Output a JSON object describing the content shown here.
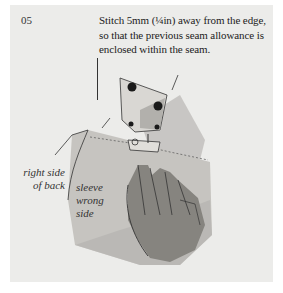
{
  "step": {
    "number": "05"
  },
  "instruction": {
    "text": "Stitch 5mm (¼in) away from the edge, so that the previous seam allowance is enclosed within the seam."
  },
  "labels": {
    "back": "right side of back",
    "sleeve": "sleeve wrong side"
  },
  "illustration": {
    "subject": "sewing machine presser foot stitching sleeve to back with hand guiding fabric",
    "colors": {
      "panel": "#ececea",
      "fabric": "#c8c6c2",
      "shadow": "#8e8c88",
      "hand": "#7c7a76",
      "ink": "#222222"
    }
  }
}
